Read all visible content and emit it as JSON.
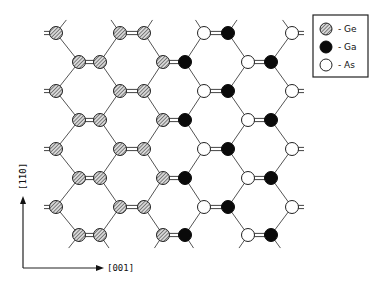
{
  "legend": {
    "items": [
      {
        "species": "Ge",
        "label": "- Ge",
        "style": "hatched"
      },
      {
        "species": "Ga",
        "label": "- Ga",
        "style": "filled"
      },
      {
        "species": "As",
        "label": "- As",
        "style": "open"
      }
    ]
  },
  "axes": {
    "horizontal_label": "[001]",
    "vertical_label": "[1̄1̄0]"
  },
  "lattice": {
    "description": "Zigzag hexagonal lattice of Ge (hatched) region on left, GaAs (Ga filled, As open) region on right",
    "rows": [
      {
        "y": 33,
        "atoms": [
          [
            "Ge",
            56
          ],
          [
            "Ge",
            120
          ],
          [
            "Ge",
            144
          ],
          [
            "As",
            204
          ],
          [
            "Ga",
            228
          ],
          [
            "As",
            292
          ]
        ]
      },
      {
        "y": 62,
        "atoms": [
          [
            "Ge",
            79
          ],
          [
            "Ge",
            100
          ],
          [
            "Ge",
            163
          ],
          [
            "Ga",
            185
          ],
          [
            "As",
            248
          ],
          [
            "Ga",
            271
          ]
        ]
      },
      {
        "y": 91,
        "atoms": [
          [
            "Ge",
            56
          ],
          [
            "Ge",
            120
          ],
          [
            "Ge",
            144
          ],
          [
            "As",
            204
          ],
          [
            "Ga",
            228
          ],
          [
            "As",
            292
          ]
        ]
      },
      {
        "y": 120,
        "atoms": [
          [
            "Ge",
            79
          ],
          [
            "Ge",
            100
          ],
          [
            "Ge",
            163
          ],
          [
            "Ga",
            185
          ],
          [
            "As",
            248
          ],
          [
            "Ga",
            271
          ]
        ]
      },
      {
        "y": 149,
        "atoms": [
          [
            "Ge",
            56
          ],
          [
            "Ge",
            120
          ],
          [
            "Ge",
            144
          ],
          [
            "As",
            204
          ],
          [
            "Ga",
            228
          ],
          [
            "As",
            292
          ]
        ]
      },
      {
        "y": 178,
        "atoms": [
          [
            "Ge",
            79
          ],
          [
            "Ge",
            100
          ],
          [
            "Ge",
            163
          ],
          [
            "Ga",
            185
          ],
          [
            "As",
            248
          ],
          [
            "Ga",
            271
          ]
        ]
      },
      {
        "y": 207,
        "atoms": [
          [
            "Ge",
            56
          ],
          [
            "Ge",
            120
          ],
          [
            "Ge",
            144
          ],
          [
            "As",
            204
          ],
          [
            "Ga",
            228
          ],
          [
            "As",
            292
          ]
        ]
      },
      {
        "y": 235,
        "atoms": [
          [
            "Ge",
            79
          ],
          [
            "Ge",
            100
          ],
          [
            "Ge",
            163
          ],
          [
            "Ga",
            185
          ],
          [
            "As",
            248
          ],
          [
            "Ga",
            271
          ]
        ]
      }
    ]
  }
}
